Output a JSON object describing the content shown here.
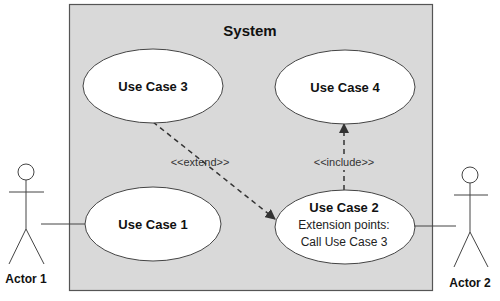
{
  "diagram": {
    "type": "UML use case diagram",
    "system": {
      "title": "System",
      "fill": "#d9d9d9",
      "stroke": "#555555"
    },
    "use_cases": [
      {
        "id": "uc1",
        "title": "Use Case 1"
      },
      {
        "id": "uc2",
        "title": "Use Case 2",
        "extension_label": "Extension points:",
        "extension_point": "Call Use Case 3"
      },
      {
        "id": "uc3",
        "title": "Use Case 3"
      },
      {
        "id": "uc4",
        "title": "Use Case 4"
      }
    ],
    "actors": [
      {
        "id": "actor1",
        "label": "Actor 1"
      },
      {
        "id": "actor2",
        "label": "Actor 2"
      }
    ],
    "relationships": [
      {
        "from": "uc3",
        "to": "uc2",
        "stereotype": "<<extend>>",
        "style": "dashed-arrow"
      },
      {
        "from": "uc2",
        "to": "uc4",
        "stereotype": "<<include>>",
        "style": "dashed-arrow"
      },
      {
        "from": "actor1",
        "to": "uc1",
        "style": "association"
      },
      {
        "from": "actor2",
        "to": "uc2",
        "style": "association"
      }
    ]
  }
}
